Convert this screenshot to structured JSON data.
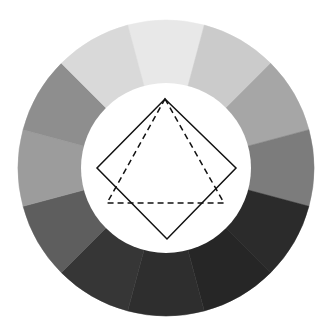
{
  "diagram": {
    "type": "grayscale-color-wheel",
    "center": [
      166,
      168
    ],
    "outer_radius": 148,
    "inner_radius": 85,
    "segment_count": 12,
    "start_angle_deg": -15,
    "segments": [
      {
        "position": "top",
        "color": "#e8e8e8"
      },
      {
        "position": "top-right-1",
        "color": "#cbcbcb"
      },
      {
        "position": "top-right-2",
        "color": "#a6a6a6"
      },
      {
        "position": "right",
        "color": "#7c7c7c"
      },
      {
        "position": "bottom-right-1",
        "color": "#2b2b2b"
      },
      {
        "position": "bottom-right-2",
        "color": "#262626"
      },
      {
        "position": "bottom",
        "color": "#2e2e2e"
      },
      {
        "position": "bottom-left-1",
        "color": "#363636"
      },
      {
        "position": "bottom-left-2",
        "color": "#5e5e5e"
      },
      {
        "position": "left",
        "color": "#9c9c9c"
      },
      {
        "position": "top-left-2",
        "color": "#8e8e8e"
      },
      {
        "position": "top-left-1",
        "color": "#d9d9d9"
      }
    ],
    "square": {
      "style": "solid",
      "stroke": "#111111",
      "points": [
        [
          165,
          99
        ],
        [
          236,
          168
        ],
        [
          167,
          239
        ],
        [
          97,
          168
        ]
      ]
    },
    "triangle": {
      "style": "dashed",
      "stroke": "#111111",
      "points": [
        [
          165,
          99
        ],
        [
          224,
          203
        ],
        [
          107,
          203
        ]
      ]
    }
  }
}
